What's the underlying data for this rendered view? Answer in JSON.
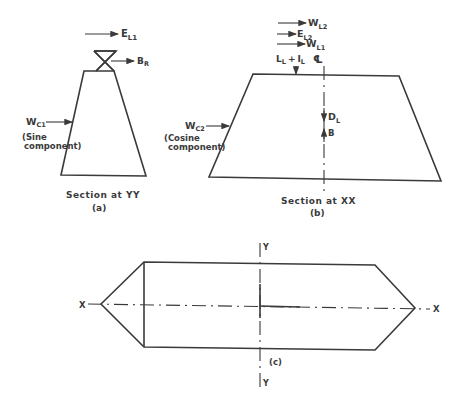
{
  "diagram": {
    "type": "structural force diagram",
    "line_color": "#3a3a3a",
    "panel_a": {
      "caption": "Section at YY",
      "sub_label": "(a)",
      "forces": {
        "e_l1": {
          "main": "E",
          "sub": "L1"
        },
        "b_r": {
          "main": "B",
          "sub": "R"
        },
        "w_c1": {
          "main": "W",
          "sub": "C1"
        }
      },
      "note_line1": "(Sine",
      "note_line2": "component)"
    },
    "panel_b": {
      "caption": "Section at XX",
      "sub_label": "(b)",
      "forces": {
        "w_l2": {
          "main": "W",
          "sub": "L2"
        },
        "e_l2": {
          "main": "E",
          "sub": "L2"
        },
        "w_l1": {
          "main": "W",
          "sub": "L1"
        },
        "ll_il": {
          "main": "L",
          "sub": "L",
          "plus": "+",
          "main2": "I",
          "sub2": "L"
        },
        "d_l": {
          "main": "D",
          "sub": "L"
        },
        "b": {
          "main": "B"
        },
        "w_c2": {
          "main": "W",
          "sub": "C2"
        }
      },
      "centerline_symbol": "℄",
      "note_line1": "(Cosine",
      "note_line2": "component)"
    },
    "panel_c": {
      "sub_label": "(c)",
      "axis_x_left": "X",
      "axis_x_right": "X",
      "axis_y_top": "Y",
      "axis_y_bottom": "Y"
    }
  }
}
